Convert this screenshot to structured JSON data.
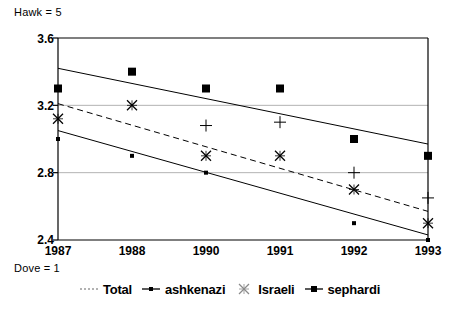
{
  "annotations": {
    "top_label": "Hawk = 5",
    "bottom_label": "Dove = 1"
  },
  "colors": {
    "axis": "#000000",
    "grid": "#b3b3b3",
    "marker": "#000000",
    "trend": "#000000"
  },
  "chart_data": {
    "type": "scatter",
    "title": "",
    "subtitle": "",
    "xlabel": "",
    "ylabel": "",
    "grid": true,
    "legend_position": "bottom",
    "categories": [
      "1987",
      "1988",
      "1990",
      "1991",
      "1992",
      "1993"
    ],
    "x_tick_labels": [
      "1987",
      "1988",
      "1990",
      "1991",
      "1992",
      "1993"
    ],
    "y_tick_labels": [
      "3.6",
      "3.2",
      "2.8",
      "2.4"
    ],
    "y_ticks": [
      3.6,
      3.2,
      2.8,
      2.4
    ],
    "ylim": [
      2.4,
      3.6
    ],
    "gridlines_y": [
      3.2,
      2.8
    ],
    "series": [
      {
        "name": "Total",
        "marker": "plus",
        "line_style": "none",
        "values": [
          null,
          null,
          3.08,
          3.1,
          2.8,
          2.65
        ]
      },
      {
        "name": "ashkenazi",
        "marker": "small-square",
        "line_style": "none",
        "values": [
          3.0,
          2.9,
          2.8,
          null,
          2.5,
          2.4
        ]
      },
      {
        "name": "Israeli",
        "marker": "x-star",
        "line_style": "none",
        "values": [
          3.12,
          3.2,
          2.9,
          2.9,
          2.7,
          2.5
        ]
      },
      {
        "name": "sephardi",
        "marker": "square",
        "line_style": "none",
        "values": [
          3.3,
          3.4,
          3.3,
          3.3,
          3.0,
          2.9
        ]
      }
    ],
    "trendlines": [
      {
        "name": "sephardi-trend",
        "style": "solid",
        "x_start": "1987",
        "y_start": 3.42,
        "x_end": "1993",
        "y_end": 2.97
      },
      {
        "name": "israeli-trend",
        "style": "dashed",
        "x_start": "1987",
        "y_start": 3.21,
        "x_end": "1993",
        "y_end": 2.57
      },
      {
        "name": "ashkenazi-trend",
        "style": "solid",
        "x_start": "1987",
        "y_start": 3.05,
        "x_end": "1993",
        "y_end": 2.43
      }
    ],
    "legend": [
      {
        "label": "Total",
        "marker": "dotted-line"
      },
      {
        "label": "ashkenazi",
        "marker": "line-small-square"
      },
      {
        "label": "Israeli",
        "marker": "x-star"
      },
      {
        "label": "sephardi",
        "marker": "line-square"
      }
    ]
  }
}
